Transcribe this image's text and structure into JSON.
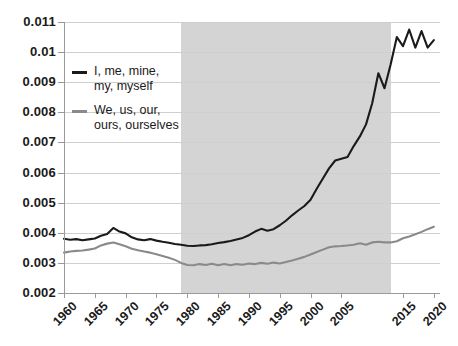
{
  "chart_data": {
    "type": "line",
    "title": "",
    "xlabel": "",
    "ylabel": "",
    "xlim": [
      1960,
      2021
    ],
    "ylim": [
      0.002,
      0.011
    ],
    "grid": true,
    "legend_position": "inside-top-left",
    "y_ticks": [
      "0.011",
      "0.01",
      "0.009",
      "0.008",
      "0.007",
      "0.006",
      "0.005",
      "0.004",
      "0.003",
      "0.002"
    ],
    "y_tick_values": [
      0.011,
      0.01,
      0.009,
      0.008,
      0.007,
      0.006,
      0.005,
      0.004,
      0.003,
      0.002
    ],
    "x_ticks": [
      "1960",
      "1965",
      "1970",
      "1975",
      "1980",
      "1985",
      "1990",
      "1995",
      "2000",
      "2005",
      "2015",
      "2020"
    ],
    "x_tick_values": [
      1960,
      1965,
      1970,
      1975,
      1980,
      1985,
      1990,
      1995,
      2000,
      2005,
      2015,
      2020
    ],
    "shaded_region": {
      "label": "",
      "x_start": 1979,
      "x_end": 2013,
      "color": "#d4d4d4"
    },
    "series": [
      {
        "name": "I, me, mine, my, myself",
        "color": "#1a1a1a",
        "x": [
          1960,
          1961,
          1962,
          1963,
          1964,
          1965,
          1966,
          1967,
          1968,
          1969,
          1970,
          1971,
          1972,
          1973,
          1974,
          1975,
          1976,
          1977,
          1978,
          1979,
          1980,
          1981,
          1982,
          1983,
          1984,
          1985,
          1986,
          1987,
          1988,
          1989,
          1990,
          1991,
          1992,
          1993,
          1994,
          1995,
          1996,
          1997,
          1998,
          1999,
          2000,
          2001,
          2002,
          2003,
          2004,
          2005,
          2006,
          2007,
          2008,
          2009,
          2010,
          2011,
          2012,
          2013,
          2014,
          2015,
          2016,
          2017,
          2018,
          2019,
          2020
        ],
        "values": [
          0.0038,
          0.00377,
          0.00379,
          0.00375,
          0.00378,
          0.00381,
          0.0039,
          0.00396,
          0.00416,
          0.00404,
          0.00398,
          0.00385,
          0.00378,
          0.00375,
          0.00379,
          0.00374,
          0.0037,
          0.00367,
          0.00363,
          0.0036,
          0.00357,
          0.00356,
          0.00358,
          0.00359,
          0.00362,
          0.00366,
          0.00369,
          0.00373,
          0.00378,
          0.00383,
          0.00392,
          0.00404,
          0.00413,
          0.00407,
          0.00412,
          0.00425,
          0.0044,
          0.00458,
          0.00474,
          0.00489,
          0.0051,
          0.00546,
          0.0058,
          0.00614,
          0.0064,
          0.00646,
          0.00652,
          0.00688,
          0.0072,
          0.0076,
          0.0083,
          0.0093,
          0.0088,
          0.0096,
          0.0105,
          0.0102,
          0.01075,
          0.01015,
          0.0107,
          0.01015,
          0.0104
        ]
      },
      {
        "name": "We, us, our, ours, ourselves",
        "color": "#8a8a8a",
        "x": [
          1960,
          1961,
          1962,
          1963,
          1964,
          1965,
          1966,
          1967,
          1968,
          1969,
          1970,
          1971,
          1972,
          1973,
          1974,
          1975,
          1976,
          1977,
          1978,
          1979,
          1980,
          1981,
          1982,
          1983,
          1984,
          1985,
          1986,
          1987,
          1988,
          1989,
          1990,
          1991,
          1992,
          1993,
          1994,
          1995,
          1996,
          1997,
          1998,
          1999,
          2000,
          2001,
          2002,
          2003,
          2004,
          2005,
          2006,
          2007,
          2008,
          2009,
          2010,
          2011,
          2012,
          2013,
          2014,
          2015,
          2016,
          2017,
          2018,
          2019,
          2020
        ],
        "values": [
          0.00334,
          0.00338,
          0.0034,
          0.00341,
          0.00344,
          0.00348,
          0.00358,
          0.00364,
          0.00368,
          0.00362,
          0.00355,
          0.00347,
          0.00342,
          0.00338,
          0.00334,
          0.00329,
          0.00323,
          0.00317,
          0.0031,
          0.003,
          0.00293,
          0.00292,
          0.00296,
          0.00293,
          0.00297,
          0.00292,
          0.00296,
          0.00292,
          0.00296,
          0.00294,
          0.00298,
          0.00296,
          0.003,
          0.00297,
          0.00301,
          0.00298,
          0.00303,
          0.00308,
          0.00314,
          0.0032,
          0.00328,
          0.00336,
          0.00344,
          0.00352,
          0.00355,
          0.00356,
          0.00358,
          0.0036,
          0.00365,
          0.0036,
          0.00368,
          0.0037,
          0.00368,
          0.00368,
          0.00372,
          0.00382,
          0.00388,
          0.00395,
          0.00403,
          0.00412,
          0.0042
        ]
      }
    ]
  },
  "legend": {
    "items": [
      {
        "label": "I, me, mine,\nmy, myself",
        "color": "#1a1a1a"
      },
      {
        "label": "We, us, our,\nours, ourselves",
        "color": "#8a8a8a"
      }
    ]
  }
}
